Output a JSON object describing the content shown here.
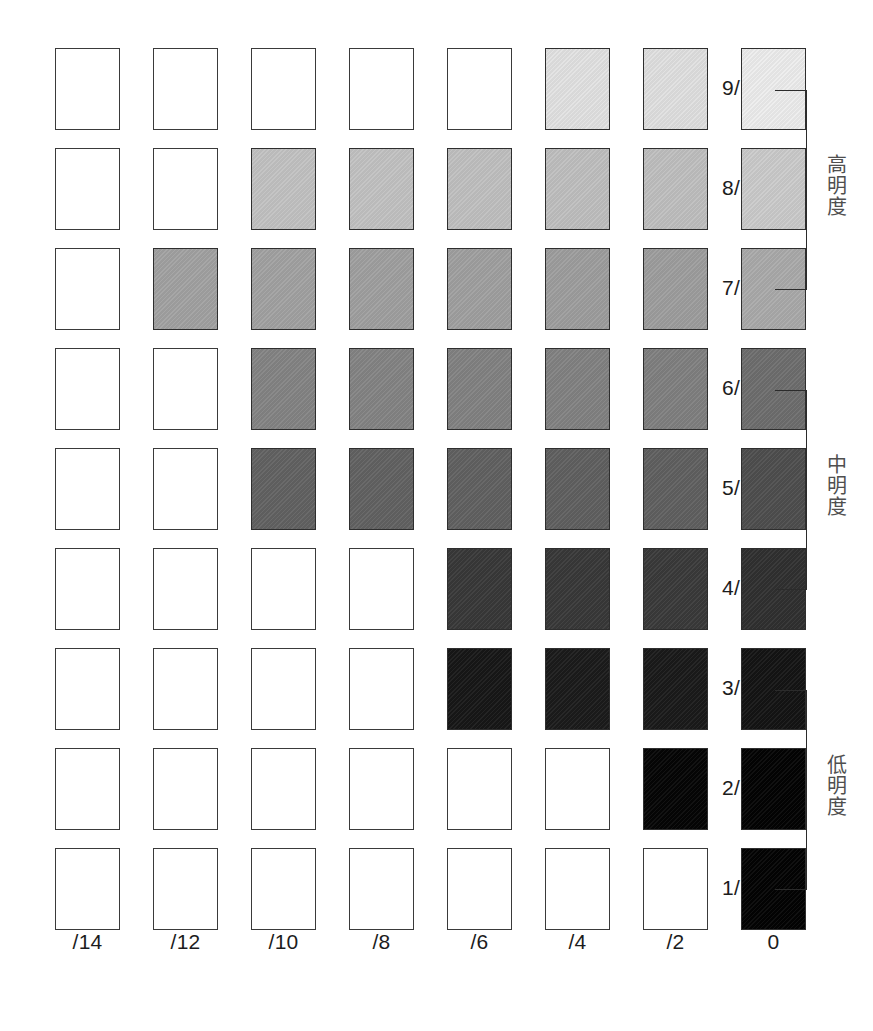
{
  "chart_data": {
    "type": "heatmap",
    "title": "",
    "xlabel": "",
    "ylabel": "",
    "columns": [
      "/14",
      "/12",
      "/10",
      "/8",
      "/6",
      "/4",
      "/2",
      "0"
    ],
    "rows": [
      "9/",
      "8/",
      "7/",
      "6/",
      "5/",
      "4/",
      "3/",
      "2/",
      "1/"
    ],
    "grid": false,
    "legend_position": "right",
    "cells": [
      {
        "row": "9/",
        "values": [
          null,
          null,
          null,
          null,
          null,
          "#e2e2e2",
          "#e0e0e0",
          "#ededed"
        ]
      },
      {
        "row": "8/",
        "values": [
          null,
          null,
          "#c2c2c2",
          "#c2c2c2",
          "#c0c0c0",
          "#bfbfbf",
          "#bfbfbf",
          "#cbcbcb"
        ]
      },
      {
        "row": "7/",
        "values": [
          null,
          "#a2a2a2",
          "#a2a2a2",
          "#a0a0a0",
          "#a0a0a0",
          "#9e9e9e",
          "#9e9e9e",
          "#aaaaaa"
        ]
      },
      {
        "row": "6/",
        "values": [
          null,
          null,
          "#848484",
          "#848484",
          "#828282",
          "#828282",
          "#808080",
          "#6e6e6e"
        ]
      },
      {
        "row": "5/",
        "values": [
          null,
          null,
          "#626262",
          "#626262",
          "#616161",
          "#606060",
          "#606060",
          "#4e4e4e"
        ]
      },
      {
        "row": "4/",
        "values": [
          null,
          null,
          null,
          null,
          "#383838",
          "#383838",
          "#3a3a3a",
          "#303030"
        ]
      },
      {
        "row": "3/",
        "values": [
          null,
          null,
          null,
          null,
          "#171717",
          "#1b1b1b",
          "#1a1a1a",
          "#141414"
        ]
      },
      {
        "row": "2/",
        "values": [
          null,
          null,
          null,
          null,
          null,
          null,
          "#050505",
          "#030303"
        ]
      },
      {
        "row": "1/",
        "values": [
          null,
          null,
          null,
          null,
          null,
          null,
          null,
          "#030303"
        ]
      }
    ]
  },
  "axis": {
    "row_labels": [
      "9/",
      "8/",
      "7/",
      "6/",
      "5/",
      "4/",
      "3/",
      "2/",
      "1/"
    ],
    "col_labels": [
      "/14",
      "/12",
      "/10",
      "/8",
      "/6",
      "/4",
      "/2",
      "0"
    ]
  },
  "groups": [
    {
      "label": "高明度",
      "start_row": 0,
      "end_row": 2
    },
    {
      "label": "中明度",
      "start_row": 3,
      "end_row": 5
    },
    {
      "label": "低明度",
      "start_row": 6,
      "end_row": 8
    }
  ],
  "colors": {
    "page_background": "#ffffff",
    "swatch_outline": "#3a3a3a",
    "label_text": "#1c1c1c",
    "group_label_text": "#4f4f4f",
    "bracket_line": "#2b2b2b"
  }
}
